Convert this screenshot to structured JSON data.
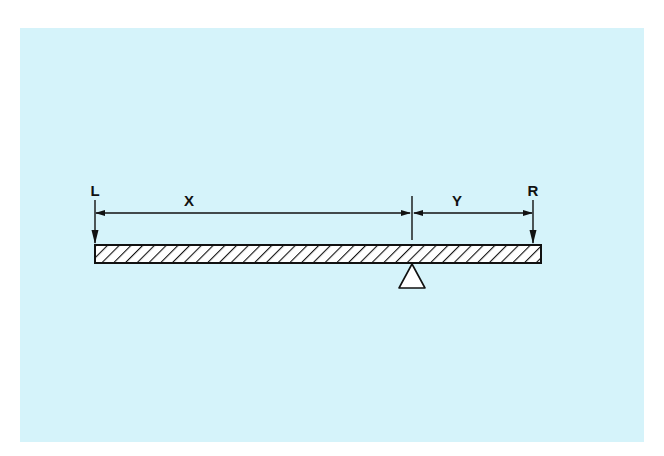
{
  "diagram": {
    "type": "lever-beam",
    "background_color": "#d5f3fa",
    "labels": {
      "left_force": "L",
      "right_force": "R",
      "left_distance": "X",
      "right_distance": "Y"
    },
    "beam": {
      "fill": "hatched",
      "left_x": 94,
      "right_x": 541,
      "top_y": 245,
      "bottom_y": 263
    },
    "fulcrum": {
      "shape": "triangle",
      "x": 412,
      "apex_y": 263,
      "base_y": 288
    },
    "forces": [
      {
        "name": "L",
        "direction": "down",
        "x": 94
      },
      {
        "name": "R",
        "direction": "down",
        "x": 533
      }
    ],
    "dimensions": [
      {
        "name": "X",
        "from": "L",
        "to": "fulcrum"
      },
      {
        "name": "Y",
        "from": "fulcrum",
        "to": "R"
      }
    ]
  }
}
